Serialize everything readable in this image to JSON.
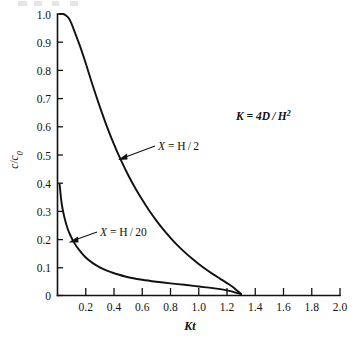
{
  "figure": {
    "background_color": "#ffffff",
    "ink_color": "#111111"
  },
  "chart_data": {
    "type": "line",
    "title": "",
    "subtitle": "",
    "xlabel": "Kt",
    "ylabel": "c/c₀",
    "xlim": [
      0,
      2.0
    ],
    "ylim": [
      0,
      1.0
    ],
    "grid": false,
    "legend_position": "inline-annotations",
    "xticks": [
      0,
      0.2,
      0.4,
      0.6,
      0.8,
      1.0,
      1.2,
      1.4,
      1.6,
      1.8,
      2.0
    ],
    "xtick_labels": [
      "0",
      "0.2",
      "0.4",
      "0.6",
      "0.8",
      "1.0",
      "1.2",
      "1.4",
      "1.6",
      "1.8",
      "2.0"
    ],
    "yticks": [
      0,
      0.1,
      0.2,
      0.3,
      0.4,
      0.5,
      0.6,
      0.7,
      0.8,
      0.9,
      1.0
    ],
    "ytick_labels": [
      "0",
      "0.1",
      "0.2",
      "0.3",
      "0.4",
      "0.5",
      "0.6",
      "0.7",
      "0.8",
      "0.9",
      "1.0"
    ],
    "annotations": [
      {
        "name": "equation",
        "text": "K = 4D/H²",
        "text_main": "K = 4D / H",
        "superscript": "2",
        "x": 0.98,
        "y": 0.645
      },
      {
        "name": "curve-label-upper",
        "text": "X = H/2",
        "symbol": "X",
        "value": " = H / 2",
        "points_to_series": "X = H/2",
        "x": 0.62,
        "y": 0.52
      },
      {
        "name": "curve-label-lower",
        "text": "X = H/20",
        "symbol": "X",
        "value": " = H / 20",
        "points_to_series": "X = H/20",
        "x": 0.37,
        "y": 0.225
      }
    ],
    "series": [
      {
        "name": "X = H/2",
        "label": "X = H/2",
        "x": [
          0.015,
          0.04,
          0.06,
          0.08,
          0.1,
          0.13,
          0.16,
          0.2,
          0.25,
          0.3,
          0.35,
          0.4,
          0.45,
          0.5,
          0.55,
          0.6,
          0.65,
          0.7,
          0.75,
          0.8,
          0.85,
          0.9,
          0.95,
          1.0,
          1.05,
          1.1,
          1.15,
          1.2,
          1.25,
          1.3
        ],
        "values": [
          1.0,
          1.0,
          0.995,
          0.985,
          0.965,
          0.925,
          0.885,
          0.825,
          0.745,
          0.67,
          0.6,
          0.537,
          0.48,
          0.428,
          0.382,
          0.34,
          0.301,
          0.266,
          0.234,
          0.205,
          0.178,
          0.154,
          0.132,
          0.112,
          0.093,
          0.076,
          0.06,
          0.044,
          0.027,
          0.005
        ]
      },
      {
        "name": "X = H/20",
        "label": "X = H/20",
        "x": [
          0.015,
          0.03,
          0.05,
          0.07,
          0.09,
          0.12,
          0.15,
          0.2,
          0.25,
          0.3,
          0.35,
          0.4,
          0.5,
          0.6,
          0.7,
          0.8,
          0.9,
          1.0,
          1.1,
          1.2,
          1.3
        ],
        "values": [
          0.395,
          0.325,
          0.275,
          0.24,
          0.215,
          0.186,
          0.164,
          0.135,
          0.115,
          0.1,
          0.088,
          0.079,
          0.065,
          0.056,
          0.049,
          0.043,
          0.038,
          0.032,
          0.026,
          0.018,
          0.005
        ]
      }
    ]
  }
}
